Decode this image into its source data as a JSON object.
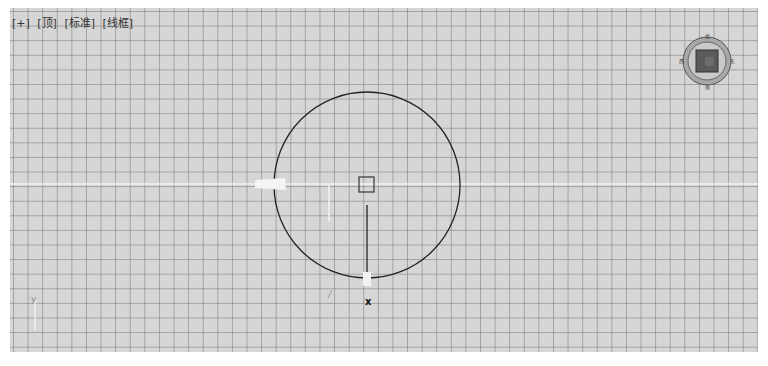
{
  "viewport": {
    "labels": [
      "[+]",
      "[顶]",
      "[标准]",
      "[线框]"
    ],
    "view_name": "顶",
    "shading_mode": "线框",
    "grid_color": "#8a8a8a",
    "background_color": "#d6d6d6"
  },
  "viewcube": {
    "icon": "viewcube-icon",
    "compass_labels": {
      "north": "北",
      "south": "南",
      "east": "东",
      "west": "西"
    },
    "face_color": "#5a5a5a",
    "ring_color": "#7a7a7a"
  },
  "scene": {
    "object": "circle",
    "center_marker": "pivot-square",
    "gizmo_axis_label": "x",
    "axis_indicator_label": "y"
  }
}
